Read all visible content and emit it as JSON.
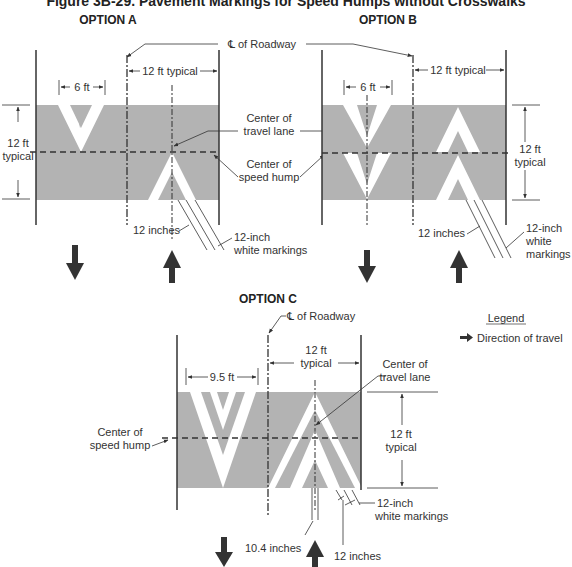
{
  "figure": {
    "title": "Figure 3B-29. Pavement Markings for Speed Humps without Crosswalks",
    "colors": {
      "pavement": "#b3b3b3",
      "marking": "#ffffff",
      "line": "#333333",
      "arrow": "#333333"
    }
  },
  "option_a": {
    "heading": "OPTION A",
    "dim_width": "6 ft",
    "dim_lane": "12 ft typical",
    "dim_height_1": "12 ft",
    "dim_height_2": "typical",
    "label_12in": "12 inches",
    "label_markings_1": "12-inch",
    "label_markings_2": "white markings"
  },
  "option_b": {
    "heading": "OPTION B",
    "dim_width": "6 ft",
    "dim_lane": "12 ft typical",
    "dim_height_1": "12 ft",
    "dim_height_2": "typical",
    "label_12in": "12 inches",
    "label_markings_1": "12-inch",
    "label_markings_2": "white",
    "label_markings_3": "markings"
  },
  "shared_ab": {
    "centerline": "℄ of Roadway",
    "center_lane_1": "Center of",
    "center_lane_2": "travel lane",
    "center_hump_1": "Center of",
    "center_hump_2": "speed hump"
  },
  "option_c": {
    "heading": "OPTION C",
    "centerline": "℄ of Roadway",
    "dim_width": "9.5 ft",
    "dim_lane_1": "12 ft",
    "dim_lane_2": "typical",
    "center_lane_1": "Center of",
    "center_lane_2": "travel lane",
    "center_hump_1": "Center of",
    "center_hump_2": "speed hump",
    "dim_height_1": "12 ft",
    "dim_height_2": "typical",
    "label_markings_1": "12-inch",
    "label_markings_2": "white markings",
    "label_10in": "10.4 inches",
    "label_12in": "12 inches"
  },
  "legend": {
    "heading": "Legend",
    "item": "Direction of travel"
  }
}
